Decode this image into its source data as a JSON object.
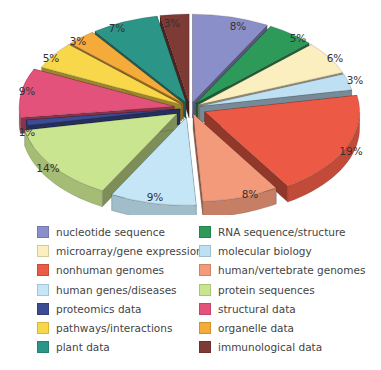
{
  "chart_data": {
    "type": "pie",
    "style": "3d exploded pie",
    "title": "",
    "legend_position": "bottom",
    "categories": [
      "nucleotide sequence",
      "RNA sequence/structure",
      "microarray/gene expression",
      "molecular biology",
      "nonhuman genomes",
      "human/vertebrate genomes",
      "human genes/diseases",
      "protein sequences",
      "proteomics data",
      "structural data",
      "pathways/interactions",
      "organelle data",
      "plant data",
      "immunological data"
    ],
    "values": [
      8,
      5,
      6,
      3,
      19,
      8,
      9,
      14,
      1,
      9,
      5,
      3,
      7,
      3
    ],
    "labels": [
      "8%",
      "5%",
      "6%",
      "3%",
      "19%",
      "8%",
      "9%",
      "14%",
      "1%",
      "9%",
      "5%",
      "3%",
      "7%",
      "3%"
    ],
    "colors": [
      "#8b8fc9",
      "#2e9a5a",
      "#fbefc0",
      "#bfe0f3",
      "#ec5a45",
      "#f29a7a",
      "#c4e6f6",
      "#c9e58f",
      "#3c4c93",
      "#e2527a",
      "#f8d84a",
      "#f5ab3a",
      "#2b9687",
      "#7e3a34"
    ]
  },
  "legend": {
    "items": [
      {
        "label": "nucleotide sequence",
        "color": "#8b8fc9"
      },
      {
        "label": "RNA sequence/structure",
        "color": "#2e9a5a"
      },
      {
        "label": "microarray/gene expression",
        "color": "#fbefc0"
      },
      {
        "label": "molecular biology",
        "color": "#bfe0f3"
      },
      {
        "label": "nonhuman genomes",
        "color": "#ec5a45"
      },
      {
        "label": "human/vertebrate genomes",
        "color": "#f29a7a"
      },
      {
        "label": "human genes/diseases",
        "color": "#c4e6f6"
      },
      {
        "label": "protein sequences",
        "color": "#c9e58f"
      },
      {
        "label": "proteomics data",
        "color": "#3c4c93"
      },
      {
        "label": "structural data",
        "color": "#e2527a"
      },
      {
        "label": "pathways/interactions",
        "color": "#f8d84a"
      },
      {
        "label": "organelle data",
        "color": "#f5ab3a"
      },
      {
        "label": "plant data",
        "color": "#2b9687"
      },
      {
        "label": "immunological data",
        "color": "#7e3a34"
      }
    ]
  },
  "slice_labels": [
    {
      "text": "8%",
      "x": 238,
      "y": 26
    },
    {
      "text": "5%",
      "x": 298,
      "y": 38
    },
    {
      "text": "6%",
      "x": 335,
      "y": 58
    },
    {
      "text": "3%",
      "x": 355,
      "y": 80
    },
    {
      "text": "19%",
      "x": 351,
      "y": 151
    },
    {
      "text": "8%",
      "x": 250,
      "y": 194
    },
    {
      "text": "9%",
      "x": 155,
      "y": 197
    },
    {
      "text": "14%",
      "x": 48,
      "y": 168
    },
    {
      "text": "1%",
      "x": 27,
      "y": 132
    },
    {
      "text": "9%",
      "x": 27,
      "y": 91
    },
    {
      "text": "5%",
      "x": 51,
      "y": 58
    },
    {
      "text": "3%",
      "x": 78,
      "y": 41
    },
    {
      "text": "7%",
      "x": 117,
      "y": 28
    },
    {
      "text": "3%",
      "x": 172,
      "y": 23
    }
  ]
}
